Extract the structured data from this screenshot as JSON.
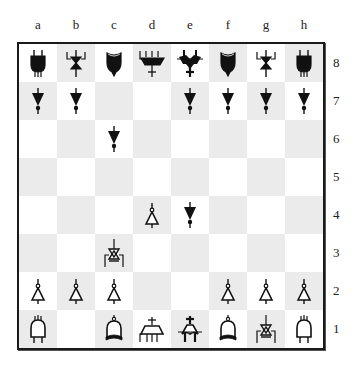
{
  "board": {
    "files": [
      "a",
      "b",
      "c",
      "d",
      "e",
      "f",
      "g",
      "h"
    ],
    "ranks": [
      "8",
      "7",
      "6",
      "5",
      "4",
      "3",
      "2",
      "1"
    ],
    "colors": {
      "light": "#ffffff",
      "dark": "#ebebeb",
      "border": "#1a1a1a",
      "piece": "#111111"
    },
    "position": [
      [
        "bR",
        "bN",
        "bB",
        "bQ",
        "bK",
        "bB",
        "bN",
        "bR"
      ],
      [
        "bP",
        "bP",
        "",
        "",
        "bP",
        "bP",
        "bP",
        "bP"
      ],
      [
        "",
        "",
        "bP",
        "",
        "",
        "",
        "",
        ""
      ],
      [
        "",
        "",
        "",
        "",
        "",
        "",
        "",
        ""
      ],
      [
        "",
        "",
        "",
        "wP",
        "bP",
        "",
        "",
        ""
      ],
      [
        "",
        "",
        "wN",
        "",
        "",
        "",
        "",
        ""
      ],
      [
        "wP",
        "wP",
        "wP",
        "",
        "",
        "wP",
        "wP",
        "wP"
      ],
      [
        "wR",
        "",
        "wB",
        "wQ",
        "wK",
        "wB",
        "wN",
        "wR"
      ]
    ],
    "piece_names": {
      "P": "pawn",
      "N": "knight",
      "B": "bishop",
      "R": "rook",
      "Q": "queen",
      "K": "king"
    }
  }
}
